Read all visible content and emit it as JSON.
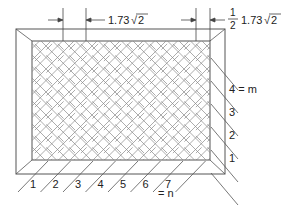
{
  "figure": {
    "dimension_left": {
      "value": "1.73",
      "radical": "2"
    },
    "dimension_right": {
      "fraction_num": "1",
      "fraction_den": "2",
      "value": "1.73",
      "radical": "2"
    },
    "bottom_labels": [
      "1",
      "2",
      "3",
      "4",
      "5",
      "6",
      "7"
    ],
    "bottom_note": "= n",
    "right_labels": [
      "1",
      "2",
      "3",
      "4 = m"
    ],
    "line_color": "#555555"
  }
}
